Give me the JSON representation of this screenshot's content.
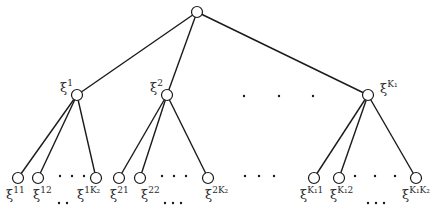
{
  "diagram": {
    "type": "tree",
    "root": {
      "id": "root",
      "x": 197,
      "y": 12,
      "label": ""
    },
    "level1": [
      {
        "id": "xi1",
        "x": 77,
        "y": 95,
        "base": "ξ",
        "sup": "1",
        "label_x": 60,
        "label_y": 92
      },
      {
        "id": "xi2",
        "x": 167,
        "y": 95,
        "base": "ξ",
        "sup": "2",
        "label_x": 150,
        "label_y": 92
      },
      {
        "id": "xiK1",
        "x": 368,
        "y": 95,
        "base": "ξ",
        "sup": "K₁",
        "label_x": 380,
        "label_y": 93
      }
    ],
    "level1_ellipsis": {
      "text": "· · ·",
      "dots": [
        [
          244,
          96
        ],
        [
          279,
          96
        ],
        [
          313,
          96
        ]
      ]
    },
    "leaves": [
      {
        "parent": 0,
        "x": 18,
        "y": 178,
        "base": "ξ",
        "sup": "11",
        "label_x": 6,
        "label_y": 199
      },
      {
        "parent": 0,
        "x": 38,
        "y": 178,
        "base": "ξ",
        "sup": "12",
        "label_x": 33,
        "label_y": 199
      },
      {
        "parent": 0,
        "x": 96,
        "y": 178,
        "base": "ξ",
        "sup": "1K₂",
        "label_x": 77,
        "label_y": 199
      },
      {
        "parent": 1,
        "x": 119,
        "y": 178,
        "base": "ξ",
        "sup": "21",
        "label_x": 110,
        "label_y": 199
      },
      {
        "parent": 1,
        "x": 140,
        "y": 178,
        "base": "ξ",
        "sup": "22",
        "label_x": 141,
        "label_y": 199
      },
      {
        "parent": 1,
        "x": 208,
        "y": 178,
        "base": "ξ",
        "sup": "2K₂",
        "label_x": 205,
        "label_y": 199
      },
      {
        "parent": 2,
        "x": 314,
        "y": 178,
        "base": "ξ",
        "sup": "K₁1",
        "label_x": 300,
        "label_y": 199
      },
      {
        "parent": 2,
        "x": 339,
        "y": 178,
        "base": "ξ",
        "sup": "K₁2",
        "label_x": 330,
        "label_y": 199
      },
      {
        "parent": 2,
        "x": 416,
        "y": 178,
        "base": "ξ",
        "sup": "K₁K₂",
        "label_x": 402,
        "label_y": 199
      }
    ],
    "leaf_ellipses": [
      {
        "dots": [
          [
            60,
            176
          ],
          [
            72,
            176
          ],
          [
            84,
            176
          ]
        ]
      },
      {
        "dots": [
          [
            59,
            203
          ],
          [
            67,
            203
          ]
        ]
      },
      {
        "dots": [
          [
            162,
            176
          ],
          [
            174,
            176
          ],
          [
            186,
            176
          ]
        ]
      },
      {
        "dots": [
          [
            165,
            203
          ],
          [
            173,
            203
          ],
          [
            181,
            203
          ]
        ]
      },
      {
        "dots": [
          [
            245,
            176
          ],
          [
            259,
            176
          ],
          [
            274,
            176
          ]
        ]
      },
      {
        "dots": [
          [
            355,
            176
          ],
          [
            375,
            176
          ],
          [
            395,
            176
          ]
        ]
      },
      {
        "dots": [
          [
            368,
            203
          ],
          [
            376,
            203
          ],
          [
            384,
            203
          ]
        ]
      }
    ],
    "node_radius": 5.5
  }
}
